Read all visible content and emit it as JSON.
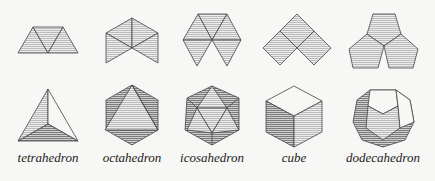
{
  "figure": {
    "solids": [
      {
        "name": "tetrahedron",
        "label": "tetrahedron",
        "x": 48
      },
      {
        "name": "octahedron",
        "label": "octahedron",
        "x": 132
      },
      {
        "name": "icosahedron",
        "label": "icosahedron",
        "x": 212
      },
      {
        "name": "cube",
        "label": "cube",
        "x": 294
      },
      {
        "name": "dodecahedron",
        "label": "dodecahedron",
        "x": 383
      }
    ],
    "colors": {
      "background": "#f7f7f5",
      "stroke": "#444444",
      "fill": "#d8d8d8",
      "dark_fill": "#b8b8b8"
    }
  }
}
